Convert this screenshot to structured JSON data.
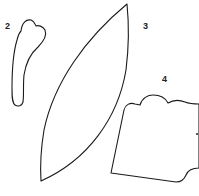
{
  "diagram": {
    "type": "shape-templates",
    "background": "#ffffff",
    "stroke_color": "#1a1a1a",
    "shapes": [
      {
        "id": "shape-2",
        "label": "2",
        "description": "elongated curved piece with heart-shaped top"
      },
      {
        "id": "shape-3",
        "label": "3",
        "description": "pointed lens / leaf shape"
      },
      {
        "id": "shape-4",
        "label": "4",
        "description": "cloud-topped tag shape"
      }
    ]
  }
}
